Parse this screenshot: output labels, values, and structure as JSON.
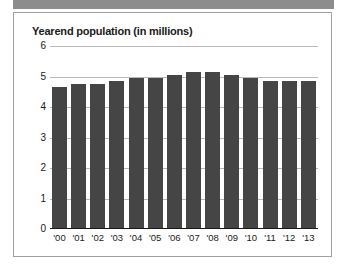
{
  "banner": {
    "label": "top-banner"
  },
  "chart_data": {
    "type": "bar",
    "title": "Yearend population (in millions)",
    "xlabel": "",
    "ylabel": "",
    "ylim": [
      0,
      6
    ],
    "yticks": [
      "6",
      "5",
      "4",
      "3",
      "2",
      "1",
      "0"
    ],
    "ytick_values": [
      6,
      5,
      4,
      3,
      2,
      1,
      0
    ],
    "grid": true,
    "legend": "none",
    "bar_color": "#454545",
    "categories": [
      "'00",
      "'01",
      "'02",
      "'03",
      "'04",
      "'05",
      "'06",
      "'07",
      "'08",
      "'09",
      "'10",
      "'11",
      "'12",
      "'13"
    ],
    "values": [
      4.6,
      4.7,
      4.7,
      4.8,
      4.9,
      4.9,
      5.0,
      5.1,
      5.1,
      5.0,
      4.9,
      4.8,
      4.8,
      4.8
    ]
  }
}
